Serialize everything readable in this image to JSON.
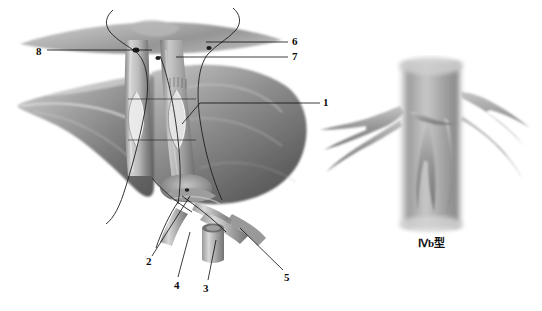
{
  "figure": {
    "background_color": "#ffffff",
    "ink_color": "#111111",
    "style": "grayscale medical line-and-wash drawing"
  },
  "labels": [
    {
      "id": "8",
      "text": "8",
      "x": 36,
      "y": 46,
      "leader": "horizontal-right"
    },
    {
      "id": "6",
      "text": "6",
      "x": 292,
      "y": 38,
      "leader": "horizontal-left"
    },
    {
      "id": "7",
      "text": "7",
      "x": 292,
      "y": 53,
      "leader": "horizontal-left"
    },
    {
      "id": "1",
      "text": "1",
      "x": 323,
      "y": 98,
      "leader": "horizontal-left"
    },
    {
      "id": "2",
      "text": "2",
      "x": 146,
      "y": 257,
      "leader": "diagonal-up-right"
    },
    {
      "id": "4",
      "text": "4",
      "x": 174,
      "y": 281,
      "leader": "diagonal-up-right"
    },
    {
      "id": "3",
      "text": "3",
      "x": 203,
      "y": 284,
      "leader": "diagonal-up-right"
    },
    {
      "id": "5",
      "text": "5",
      "x": 284,
      "y": 273,
      "leader": "diagonal-up-left"
    }
  ],
  "caption": {
    "inset_label": "Ⅳb型",
    "x": 418,
    "y": 234
  },
  "panels": {
    "main": {
      "name": "liver-and-biliary-tree",
      "x": 0,
      "y": 0,
      "width": 340,
      "height": 300
    },
    "inset": {
      "name": "duct-branching-detail",
      "x": 345,
      "y": 55,
      "width": 195,
      "height": 175
    }
  },
  "colors": {
    "tissue_light": "#d8d8d8",
    "tissue_mid": "#a8a8a8",
    "tissue_dark": "#6e6e6e",
    "tissue_deep": "#4a4a4a",
    "duct_light": "#cfcfcf",
    "duct_dark": "#777777",
    "outline": "#111111",
    "suture": "#2a2a2a"
  }
}
